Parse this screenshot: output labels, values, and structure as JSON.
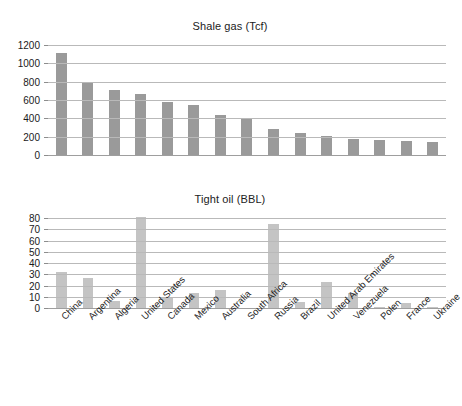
{
  "chart_data": [
    {
      "type": "bar",
      "title": "Shale gas (Tcf)",
      "xlabel": "",
      "ylabel": "",
      "ylim": [
        0,
        1200
      ],
      "yticks": [
        0,
        200,
        400,
        600,
        800,
        1000,
        1200
      ],
      "grid": true,
      "legend": "none",
      "bar_color": "#9a9a9a",
      "categories": [
        "China",
        "Argentina",
        "Algeria",
        "United States",
        "Canada",
        "Mexico",
        "Australia",
        "South Africa",
        "Russia",
        "Brazil",
        "United Arab Emirates",
        "Venezuela",
        "Polen",
        "France",
        "Ukraine"
      ],
      "values": [
        1115,
        802,
        707,
        665,
        579,
        545,
        437,
        402,
        285,
        245,
        212,
        180,
        165,
        155,
        145
      ]
    },
    {
      "type": "bar",
      "title": "Tight oil (BBL)",
      "xlabel": "",
      "ylabel": "",
      "ylim": [
        0,
        80
      ],
      "yticks": [
        0,
        10,
        20,
        30,
        40,
        50,
        60,
        70,
        80
      ],
      "grid": true,
      "legend": "none",
      "bar_color": "#c4c4c4",
      "categories": [
        "China",
        "Argentina",
        "Algeria",
        "United States",
        "Canada",
        "Mexico",
        "Australia",
        "South Africa",
        "Russia",
        "Brazil",
        "United Arab Emirates",
        "Venezuela",
        "Polen",
        "France",
        "Ukraine"
      ],
      "values": [
        32,
        27,
        6,
        81,
        9,
        13,
        16,
        0,
        75,
        5,
        23,
        13,
        1,
        4.5,
        1
      ]
    }
  ],
  "top_chart": {
    "title": "Shale gas (Tcf)"
  },
  "bottom_chart": {
    "title": "Tight oil (BBL)"
  }
}
